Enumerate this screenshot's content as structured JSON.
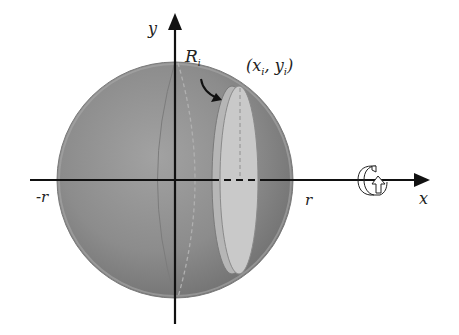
{
  "diagram": {
    "labels": {
      "y_axis": "y",
      "x_axis": "x",
      "neg_r": "-r",
      "pos_r": "r",
      "radius_label": "R",
      "radius_sub": "i",
      "point_open": "(x",
      "point_sub1": "i",
      "point_mid": ", y",
      "point_sub2": "i",
      "point_close": ")"
    },
    "colors": {
      "sphere_fill": "#8c8c8c",
      "sphere_highlight": "#a4a4a4",
      "sphere_shadow": "#6e6e6e",
      "disk_face": "#c8c8c8",
      "disk_rim": "#b4b4b4",
      "axis": "#111111"
    },
    "icons": {
      "rotation": "rotation-about-x-axis-icon"
    }
  }
}
